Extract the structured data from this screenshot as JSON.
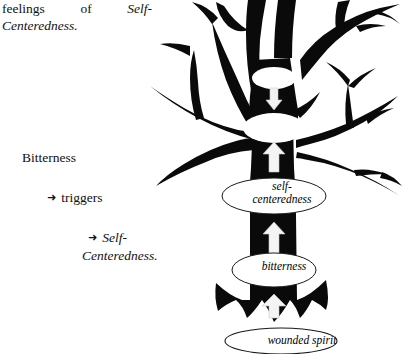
{
  "page": {
    "background_color": "#ffffff",
    "ink_color": "#000000"
  },
  "text_column": {
    "paragraph": {
      "line1_words": [
        "feelings",
        "of",
        "Self-"
      ],
      "line2": "Centeredness."
    },
    "chain": {
      "root_word": "Bitterness",
      "items": [
        {
          "bullet": "arrow-right-glyph",
          "label": "triggers"
        },
        {
          "bullet": "arrow-right-glyph",
          "label": "Self-",
          "label_continued": "Centeredness."
        }
      ]
    },
    "arrow_glyph": "➜"
  },
  "diagram": {
    "type": "tree-silhouette",
    "caption_labels": [
      {
        "name": "self-centeredness",
        "text": "self-",
        "text2": "centeredness"
      },
      {
        "name": "bitterness",
        "text": "bitterness"
      },
      {
        "name": "wounded-spirit",
        "text": "wounded spirit"
      }
    ],
    "self_centeredness_label": {
      "line1": "self-",
      "line2": "centeredness"
    },
    "bitterness_label": "bitterness",
    "wounded_spirit_label": "wounded spirit",
    "flow_arrows": 3,
    "empty_nodes": 2
  }
}
